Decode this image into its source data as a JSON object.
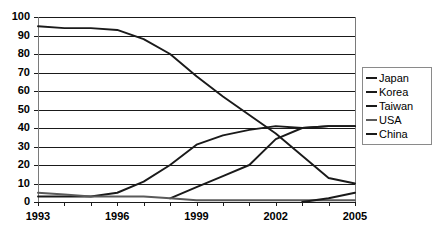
{
  "chart_data": {
    "type": "line",
    "title": "",
    "xlabel": "",
    "ylabel": "",
    "xlim": [
      1993,
      2005
    ],
    "ylim": [
      0,
      100
    ],
    "grid": true,
    "legend_position": "right",
    "x": [
      1993,
      1994,
      1995,
      1996,
      1997,
      1998,
      1999,
      2000,
      2001,
      2002,
      2003,
      2004,
      2005
    ],
    "y_ticks": [
      "0",
      "10",
      "20",
      "30",
      "40",
      "50",
      "60",
      "70",
      "80",
      "90",
      "100"
    ],
    "x_ticks": [
      "1993",
      "1996",
      "1999",
      "2002",
      "2005"
    ],
    "series": [
      {
        "name": "Japan",
        "color": "#1a1a1a",
        "x": [
          1993,
          1994,
          1995,
          1996,
          1997,
          1998,
          1999,
          2000,
          2001,
          2002,
          2003,
          2004,
          2005
        ],
        "values": [
          95,
          94,
          94,
          93,
          88,
          80,
          68,
          57,
          47,
          37,
          25,
          13,
          10
        ]
      },
      {
        "name": "Korea",
        "color": "#1a1a1a",
        "x": [
          1993,
          1994,
          1995,
          1996,
          1997,
          1998,
          1999,
          2000,
          2001,
          2002,
          2003,
          2004,
          2005
        ],
        "values": [
          3,
          3,
          3,
          5,
          11,
          20,
          31,
          36,
          39,
          41,
          40,
          41,
          41
        ]
      },
      {
        "name": "Taiwan",
        "color": "#1a1a1a",
        "x": [
          1998,
          1999,
          2000,
          2001,
          2002,
          2003,
          2004,
          2005
        ],
        "values": [
          2,
          8,
          14,
          20,
          34,
          40,
          41,
          41
        ]
      },
      {
        "name": "USA",
        "color": "#5a5a5a",
        "x": [
          1993,
          1994,
          1995,
          1996,
          1997,
          1998,
          1999,
          2000,
          2001,
          2002,
          2003,
          2004,
          2005
        ],
        "values": [
          5,
          4,
          3,
          3,
          3,
          2,
          1,
          1,
          1,
          1,
          1,
          1,
          1
        ]
      },
      {
        "name": "China",
        "color": "#1a1a1a",
        "x": [
          2003,
          2004,
          2005
        ],
        "values": [
          0,
          2,
          5
        ]
      }
    ]
  },
  "legend": {
    "items": [
      {
        "label": "Japan"
      },
      {
        "label": "Korea"
      },
      {
        "label": "Taiwan"
      },
      {
        "label": "USA"
      },
      {
        "label": "China"
      }
    ]
  }
}
